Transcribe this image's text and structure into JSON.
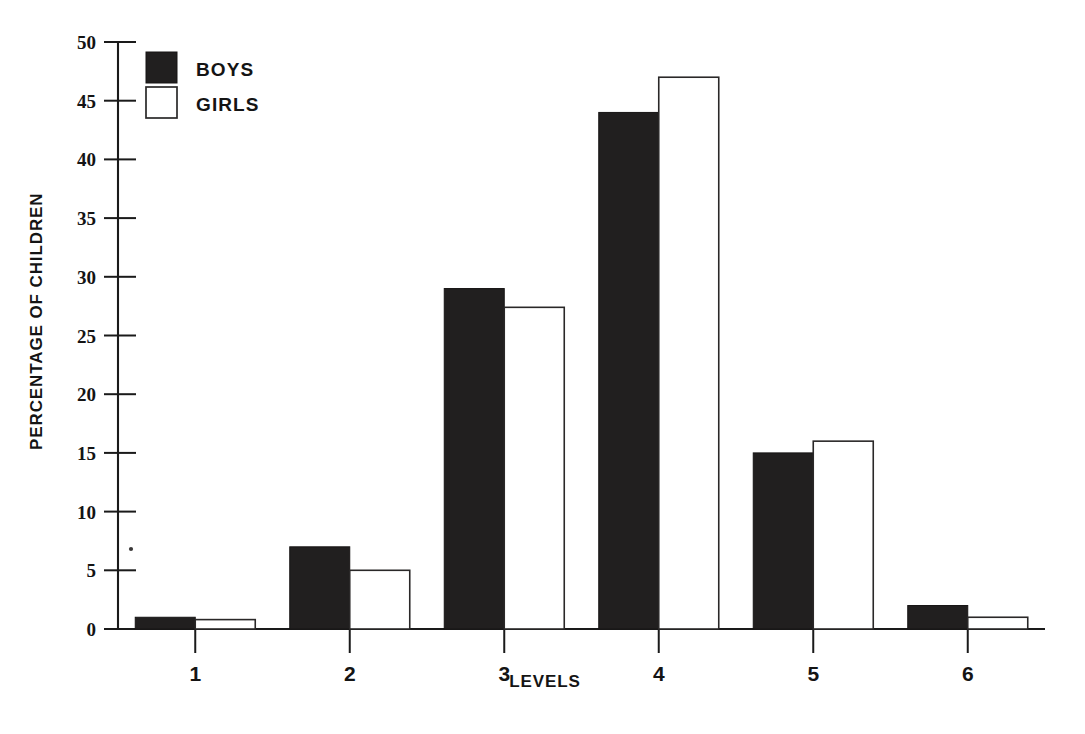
{
  "chart_data": {
    "type": "bar",
    "title": "",
    "subtitle": "",
    "xlabel": "LEVELS",
    "ylabel": "PERCENTAGE OF CHILDREN",
    "categories": [
      "1",
      "2",
      "3",
      "4",
      "5",
      "6"
    ],
    "series": [
      {
        "name": "BOYS",
        "color": "#211f1f",
        "fill": "solid-black",
        "values": [
          1.0,
          7.0,
          29.0,
          44.0,
          15.0,
          2.0
        ]
      },
      {
        "name": "GIRLS",
        "color": "#ffffff",
        "fill": "white-outline",
        "values": [
          0.8,
          5.0,
          27.4,
          47.0,
          16.0,
          1.0
        ]
      }
    ],
    "ylim": [
      0,
      50
    ],
    "yticks": [
      0,
      5,
      10,
      15,
      20,
      25,
      30,
      35,
      40,
      45,
      50
    ],
    "ytick_labels": [
      "0",
      "5",
      "10",
      "15",
      "20",
      "25",
      "30",
      "35",
      "40",
      "45",
      "50"
    ],
    "xtick_labels": [
      "1",
      "2",
      "3",
      "4",
      "5",
      "6"
    ],
    "grid": false,
    "legend_position": "top-left",
    "legend_entries": [
      "BOYS",
      "GIRLS"
    ]
  },
  "legend": {
    "items": [
      {
        "label": "BOYS",
        "swatch": "filled-black-square"
      },
      {
        "label": "GIRLS",
        "swatch": "white-outline-square"
      }
    ]
  },
  "axes": {
    "y_title": "PERCENTAGE OF CHILDREN",
    "x_title": "LEVELS"
  }
}
